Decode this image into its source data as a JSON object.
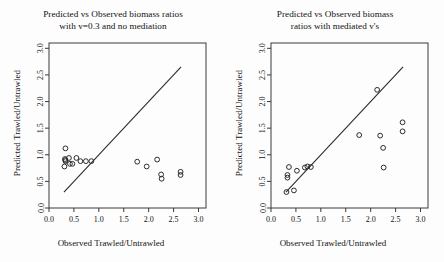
{
  "figure": {
    "axis_x_label": "Observed Trawled/Untrawled",
    "axis_y_label": "Predicted Trawled/Untrawled"
  },
  "panels": [
    {
      "id": "left",
      "title_line1": "Predicted vs Observed biomass ratios",
      "title_line2": "with v=0.3 and no mediation"
    },
    {
      "id": "right",
      "title_line1": "Predicted vs Observed biomass",
      "title_line2": "ratios with mediated v's"
    }
  ],
  "chart_data": [
    {
      "type": "scatter",
      "title": "Predicted vs Observed biomass ratios with v=0.3 and no mediation",
      "xlabel": "Observed Trawled/Untrawled",
      "ylabel": "Predicted Trawled/Untrawled",
      "xlim": [
        0.0,
        3.15
      ],
      "ylim": [
        0.0,
        3.1
      ],
      "xticks": [
        "0.0",
        "0.5",
        "1.0",
        "1.5",
        "2.0",
        "2.5",
        "3.0"
      ],
      "xtick_values": [
        0.0,
        0.5,
        1.0,
        1.5,
        2.0,
        2.5,
        3.0
      ],
      "yticks": [
        "0.0",
        "0.5",
        "1.0",
        "1.5",
        "2.0",
        "2.5",
        "3.0"
      ],
      "ytick_values": [
        0.0,
        0.5,
        1.0,
        1.5,
        2.0,
        2.5,
        3.0
      ],
      "grid": false,
      "legend": "none",
      "marker": "open-circle",
      "reference_line": {
        "label": "1:1 line",
        "x": [
          0.3,
          2.65
        ],
        "y": [
          0.3,
          2.65
        ]
      },
      "points": [
        {
          "x": 0.33,
          "y": 1.12
        },
        {
          "x": 0.32,
          "y": 0.92
        },
        {
          "x": 0.33,
          "y": 0.9
        },
        {
          "x": 0.33,
          "y": 0.88
        },
        {
          "x": 0.31,
          "y": 0.78
        },
        {
          "x": 0.4,
          "y": 0.94
        },
        {
          "x": 0.42,
          "y": 0.83
        },
        {
          "x": 0.47,
          "y": 0.83
        },
        {
          "x": 0.55,
          "y": 0.94
        },
        {
          "x": 0.63,
          "y": 0.88
        },
        {
          "x": 0.74,
          "y": 0.88
        },
        {
          "x": 0.85,
          "y": 0.88
        },
        {
          "x": 1.77,
          "y": 0.87
        },
        {
          "x": 1.96,
          "y": 0.78
        },
        {
          "x": 2.17,
          "y": 0.91
        },
        {
          "x": 2.25,
          "y": 0.63
        },
        {
          "x": 2.26,
          "y": 0.55
        },
        {
          "x": 2.64,
          "y": 0.68
        },
        {
          "x": 2.64,
          "y": 0.62
        }
      ]
    },
    {
      "type": "scatter",
      "title": "Predicted vs Observed biomass ratios with mediated v's",
      "xlabel": "Observed Trawled/Untrawled",
      "ylabel": "Predicted Trawled/Untrawled",
      "xlim": [
        0.0,
        3.15
      ],
      "ylim": [
        0.0,
        3.1
      ],
      "xticks": [
        "0.0",
        "0.5",
        "1.0",
        "1.5",
        "2.0",
        "2.5",
        "3.0"
      ],
      "xtick_values": [
        0.0,
        0.5,
        1.0,
        1.5,
        2.0,
        2.5,
        3.0
      ],
      "yticks": [
        "0.0",
        "0.5",
        "1.0",
        "1.5",
        "2.0",
        "2.5",
        "3.0"
      ],
      "ytick_values": [
        0.0,
        0.5,
        1.0,
        1.5,
        2.0,
        2.5,
        3.0
      ],
      "grid": false,
      "legend": "none",
      "marker": "open-circle",
      "reference_line": {
        "label": "1:1 line",
        "x": [
          0.3,
          2.65
        ],
        "y": [
          0.3,
          2.65
        ]
      },
      "points": [
        {
          "x": 0.31,
          "y": 0.3
        },
        {
          "x": 0.33,
          "y": 0.57
        },
        {
          "x": 0.33,
          "y": 0.62
        },
        {
          "x": 0.36,
          "y": 0.77
        },
        {
          "x": 0.46,
          "y": 0.33
        },
        {
          "x": 0.52,
          "y": 0.7
        },
        {
          "x": 0.68,
          "y": 0.76
        },
        {
          "x": 0.73,
          "y": 0.78
        },
        {
          "x": 0.8,
          "y": 0.77
        },
        {
          "x": 1.77,
          "y": 1.37
        },
        {
          "x": 2.13,
          "y": 2.22
        },
        {
          "x": 2.19,
          "y": 1.36
        },
        {
          "x": 2.25,
          "y": 1.13
        },
        {
          "x": 2.26,
          "y": 0.76
        },
        {
          "x": 2.64,
          "y": 1.61
        },
        {
          "x": 2.64,
          "y": 1.44
        }
      ]
    }
  ]
}
